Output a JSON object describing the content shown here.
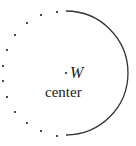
{
  "diagram": {
    "type": "circle-half-solid-half-dotted",
    "colors": {
      "stroke": "#333333",
      "dot": "#222222",
      "text": "#222222"
    },
    "point_label": "W",
    "point_marker": "·",
    "center_label": "center",
    "solid_arc": {
      "cx": 66,
      "cy": 73,
      "r": 62,
      "side": "right"
    },
    "dotted_arc": {
      "side": "left",
      "dots": [
        [
          57,
          12
        ],
        [
          41,
          15
        ],
        [
          27,
          23
        ],
        [
          15,
          35
        ],
        [
          7,
          50
        ],
        [
          3,
          66
        ],
        [
          3,
          81
        ],
        [
          7,
          97
        ],
        [
          15,
          112
        ],
        [
          27,
          123
        ],
        [
          41,
          131
        ],
        [
          57,
          136
        ]
      ]
    }
  }
}
